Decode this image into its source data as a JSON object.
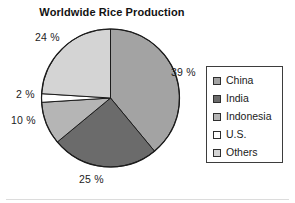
{
  "chart_data": {
    "type": "pie",
    "title": "Worldwide Rice Production",
    "xlabel": "",
    "ylabel": "",
    "legend_position": "right",
    "grid": false,
    "categories": [
      "China",
      "India",
      "Indonesia",
      "U.S.",
      "Others"
    ],
    "values": [
      39,
      25,
      10,
      2,
      24
    ],
    "value_labels": [
      "39 %",
      "25 %",
      "10 %",
      "2 %",
      "24 %"
    ],
    "units": "percent",
    "start_angle_deg": 0,
    "direction": "clockwise",
    "slice_colors": [
      "#a3a3a3",
      "#6b6b6b",
      "#b5b5b5",
      "#ffffff",
      "#d4d4d4"
    ],
    "outline_color": "#1c1c1c",
    "slices": [
      {
        "name": "China",
        "value": 39,
        "label": "39 %",
        "color": "#a3a3a3"
      },
      {
        "name": "India",
        "value": 25,
        "label": "25 %",
        "color": "#6b6b6b"
      },
      {
        "name": "Indonesia",
        "value": 10,
        "label": "10 %",
        "color": "#b5b5b5"
      },
      {
        "name": "U.S.",
        "value": 2,
        "label": "2 %",
        "color": "#ffffff"
      },
      {
        "name": "Others",
        "value": 24,
        "label": "24 %",
        "color": "#d4d4d4"
      }
    ]
  },
  "title": "Worldwide Rice Production",
  "labels": {
    "china": "39 %",
    "india": "25 %",
    "indonesia": "10 %",
    "us": "2 %",
    "others": "24 %"
  },
  "legend": {
    "items": [
      {
        "label": "China",
        "color": "#a3a3a3"
      },
      {
        "label": "India",
        "color": "#6b6b6b"
      },
      {
        "label": "Indonesia",
        "color": "#b5b5b5"
      },
      {
        "label": "U.S.",
        "color": "#ffffff"
      },
      {
        "label": "Others",
        "color": "#d4d4d4"
      }
    ]
  }
}
